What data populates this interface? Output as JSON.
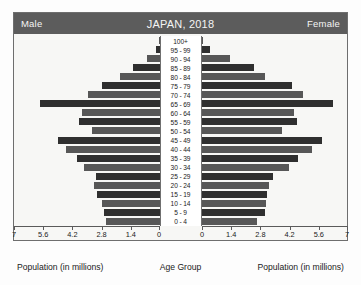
{
  "header": {
    "left_label": "Male",
    "title": "JAPAN, 2018",
    "right_label": "Female"
  },
  "captions": {
    "left": "Population (in millions)",
    "center": "Age Group",
    "right": "Population (in millions)"
  },
  "axis": {
    "left_ticks": [
      "7",
      "5.6",
      "4.2",
      "2.8",
      "1.4",
      "0"
    ],
    "right_ticks": [
      "0",
      "1.4",
      "2.8",
      "4.2",
      "5.6",
      "7"
    ],
    "max": 7,
    "tick_step": 1.4
  },
  "colors": {
    "header_bg": "#5c5c5c",
    "header_text": "#f4f4f4",
    "bar_dark": "#2f2f2f",
    "bar_mid": "#575757",
    "panel_bg": "#f7f7f5",
    "frame_border": "#6e6e6e"
  },
  "chart_data": {
    "type": "bar",
    "chart_subtype": "population-pyramid",
    "title": "JAPAN, 2018",
    "xlabel": "Population (in millions)",
    "ylabel": "Age Group",
    "xlim": [
      0,
      7
    ],
    "xticks": [
      0,
      1.4,
      2.8,
      4.2,
      5.6,
      7
    ],
    "grid": false,
    "legend_position": "header-corners",
    "categories": [
      "100+",
      "95 - 99",
      "90 - 94",
      "85 - 89",
      "80 - 84",
      "75 - 79",
      "70 - 74",
      "65 - 69",
      "60 - 64",
      "55 - 59",
      "50 - 54",
      "45 - 49",
      "40 - 44",
      "35 - 39",
      "30 - 34",
      "25 - 29",
      "20 - 24",
      "15 - 19",
      "10 - 14",
      "5 - 9",
      "0 - 4"
    ],
    "series": [
      {
        "name": "Male",
        "side": "left",
        "values": [
          0.01,
          0.17,
          0.6,
          1.25,
          1.9,
          2.75,
          3.45,
          5.75,
          3.7,
          3.85,
          3.25,
          4.85,
          4.5,
          3.95,
          3.6,
          3.05,
          3.15,
          3.0,
          2.75,
          2.65,
          2.55
        ]
      },
      {
        "name": "Female",
        "side": "right",
        "values": [
          0.06,
          0.4,
          1.35,
          2.5,
          3.05,
          4.35,
          4.85,
          6.3,
          4.45,
          4.6,
          3.85,
          5.8,
          5.3,
          4.65,
          4.2,
          3.45,
          3.25,
          3.15,
          3.1,
          3.05,
          2.65
        ]
      }
    ]
  }
}
